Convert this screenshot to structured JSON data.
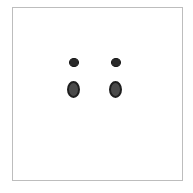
{
  "canvas": {
    "background": "#ffffff",
    "border_color": "#bdbdbd"
  },
  "shapes": [
    {
      "kind": "small-dot",
      "x": 74,
      "y": 62,
      "color": "#2a2a2a"
    },
    {
      "kind": "small-dot",
      "x": 116,
      "y": 62,
      "color": "#2a2a2a"
    },
    {
      "kind": "large-oval",
      "x": 74,
      "y": 90,
      "color": "#4a4a4a"
    },
    {
      "kind": "large-oval",
      "x": 116,
      "y": 90,
      "color": "#4a4a4a"
    }
  ]
}
